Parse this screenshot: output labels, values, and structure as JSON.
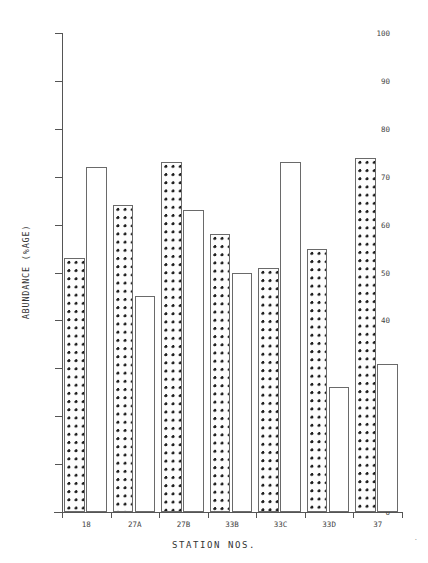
{
  "chart_data": {
    "type": "bar",
    "title": "",
    "xlabel": "STATION NOS.",
    "ylabel": "ABUNDANCE (%AGE)",
    "ylim": [
      0,
      100
    ],
    "yticks": [
      0,
      10,
      20,
      30,
      40,
      50,
      60,
      70,
      80,
      90,
      100
    ],
    "ytick_labels": [
      "0",
      "10",
      "20",
      "30",
      "40",
      "50",
      "60",
      "70",
      "80",
      "90",
      "100"
    ],
    "grid": false,
    "legend": "none",
    "categories": [
      "18",
      "27A",
      "27B",
      "33B",
      "33C",
      "33D",
      "37"
    ],
    "bars": [
      {
        "station": "18",
        "fill": "starred",
        "value": 53
      },
      {
        "station": "18",
        "fill": "plain",
        "value": 72
      },
      {
        "station": "27A",
        "fill": "starred",
        "value": 64
      },
      {
        "station": "27A",
        "fill": "plain",
        "value": 45
      },
      {
        "station": "27B",
        "fill": "starred",
        "value": 73
      },
      {
        "station": "27B",
        "fill": "plain",
        "value": 63
      },
      {
        "station": "33B",
        "fill": "starred",
        "value": 58
      },
      {
        "station": "33B",
        "fill": "plain",
        "value": 50
      },
      {
        "station": "33C",
        "fill": "starred",
        "value": 51
      },
      {
        "station": "33C",
        "fill": "plain",
        "value": 73
      },
      {
        "station": "33D",
        "fill": "starred",
        "value": 55
      },
      {
        "station": "33D",
        "fill": "plain",
        "value": 26
      },
      {
        "station": "37",
        "fill": "starred",
        "value": 74
      },
      {
        "station": "37",
        "fill": "plain",
        "value": 31
      }
    ],
    "series": [
      {
        "name": "starred",
        "values": [
          53,
          64,
          73,
          58,
          51,
          55,
          74
        ]
      },
      {
        "name": "plain",
        "values": [
          72,
          45,
          63,
          50,
          73,
          26,
          31
        ]
      }
    ]
  },
  "marks": {
    "corner": "."
  }
}
